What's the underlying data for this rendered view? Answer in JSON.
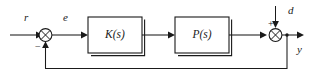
{
  "diagram": {
    "type": "control-system-block-diagram",
    "stroke_color": "#1a1a1a",
    "background_color": "#ffffff",
    "signals": {
      "reference": "r",
      "error": "e",
      "disturbance": "d",
      "output": "y"
    },
    "signs": {
      "feedback_sign": "−",
      "disturbance_sign": "+"
    },
    "blocks": [
      {
        "id": "controller",
        "label": "K(s)"
      },
      {
        "id": "plant",
        "label": "P(s)"
      }
    ],
    "junctions": [
      {
        "id": "error-junction",
        "glyph": "⊗"
      },
      {
        "id": "disturbance-junction",
        "glyph": "⊗"
      }
    ]
  }
}
